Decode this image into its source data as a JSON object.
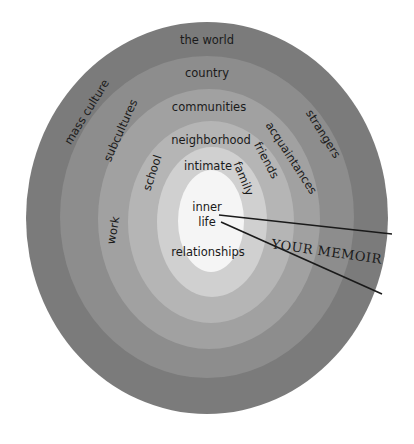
{
  "diagram": {
    "rings": [
      {
        "name": "outer",
        "color": "#7b7b7b",
        "cx": 207,
        "cy": 218,
        "rx": 181,
        "ry": 196
      },
      {
        "name": "ring2",
        "color": "#8d8d8d",
        "cx": 207,
        "cy": 217,
        "rx": 147,
        "ry": 161
      },
      {
        "name": "ring3",
        "color": "#a1a1a1",
        "cx": 209,
        "cy": 219,
        "rx": 111,
        "ry": 130
      },
      {
        "name": "ring4",
        "color": "#b5b5b5",
        "cx": 211,
        "cy": 222,
        "rx": 83,
        "ry": 101
      },
      {
        "name": "ring5",
        "color": "#d0d0d0",
        "cx": 212,
        "cy": 222,
        "rx": 55,
        "ry": 75
      },
      {
        "name": "core",
        "color": "#f5f5f5",
        "cx": 211,
        "cy": 221,
        "rx": 33,
        "ry": 51
      }
    ],
    "labels": {
      "the_world": "the world",
      "country": "country",
      "communities": "communities",
      "neighborhood": "neighborhood",
      "intimate": "intimate",
      "inner": "inner",
      "life": "life",
      "relationships": "relationships",
      "family": "family",
      "friends": "friends",
      "acquaintances": "acquaintances",
      "strangers": "strangers",
      "mass_culture": "mass culture",
      "subcultures": "subcultures",
      "school": "school",
      "work": "work"
    },
    "callout": {
      "label": "YOUR MEMOIR",
      "line_color": "#1a1a1a"
    }
  }
}
